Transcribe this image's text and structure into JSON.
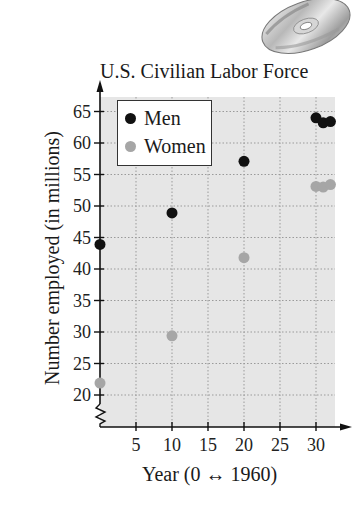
{
  "title": "U.S. Civilian Labor Force",
  "colors": {
    "men": "#111111",
    "women": "#a6a6a6",
    "plot_bg": "#e6e6e6",
    "grid": "#9a9a9a"
  },
  "legend": {
    "entries": [
      {
        "label": "Men",
        "color": "#111111"
      },
      {
        "label": "Women",
        "color": "#a6a6a6"
      }
    ]
  },
  "decoration": {
    "icon": "cd-disc-icon"
  },
  "chart_data": {
    "type": "scatter",
    "title": "U.S. Civilian Labor Force",
    "xlabel": "Year (0 ↔ 1960)",
    "ylabel": "Number employed (in millions)",
    "x_ticks": [
      5,
      10,
      15,
      20,
      25,
      30
    ],
    "y_ticks": [
      20,
      25,
      30,
      35,
      40,
      45,
      50,
      55,
      60,
      65
    ],
    "xlim": [
      0,
      33
    ],
    "ylim": [
      15,
      67
    ],
    "y_axis_break": true,
    "grid": true,
    "legend_position": "upper left",
    "series": [
      {
        "name": "Men",
        "color": "#111111",
        "points": [
          {
            "x": 0,
            "y": 43.9
          },
          {
            "x": 10,
            "y": 48.9
          },
          {
            "x": 20,
            "y": 57.1
          },
          {
            "x": 30,
            "y": 64.0
          },
          {
            "x": 31,
            "y": 63.2
          },
          {
            "x": 32,
            "y": 63.4
          }
        ]
      },
      {
        "name": "Women",
        "color": "#a6a6a6",
        "points": [
          {
            "x": 0,
            "y": 21.9
          },
          {
            "x": 10,
            "y": 29.4
          },
          {
            "x": 20,
            "y": 41.8
          },
          {
            "x": 30,
            "y": 53.1
          },
          {
            "x": 31,
            "y": 53.0
          },
          {
            "x": 32,
            "y": 53.4
          }
        ]
      }
    ]
  }
}
